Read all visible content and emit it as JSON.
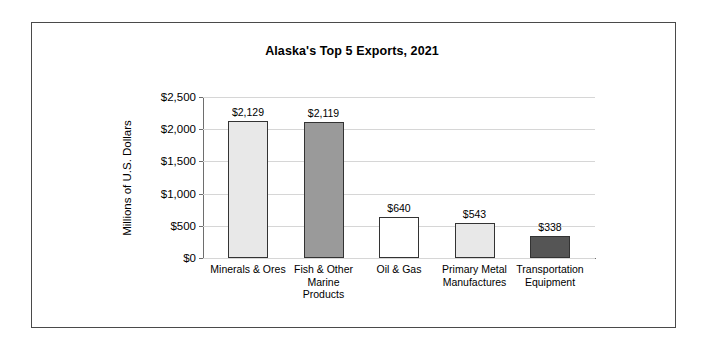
{
  "chart_data": {
    "type": "bar",
    "title": "Alaska's Top 5 Exports, 2021",
    "xlabel": "",
    "ylabel": "Millions of U.S. Dollars",
    "categories": [
      "Minerals & Ores",
      "Fish & Other Marine Products",
      "Oil & Gas",
      "Primary Metal Manufactures",
      "Transportation Equipment"
    ],
    "values": [
      2129,
      2119,
      640,
      543,
      338
    ],
    "value_labels": [
      "$2,129",
      "$2,119",
      "$640",
      "$543",
      "$338"
    ],
    "bar_colors": [
      "#e8e8e8",
      "#9a9a9a",
      "#ffffff",
      "#e8e8e8",
      "#555555"
    ],
    "bar_border_color": "#333333",
    "ylim": [
      0,
      2500
    ],
    "ytick_values": [
      0,
      500,
      1000,
      1500,
      2000,
      2500
    ],
    "ytick_labels": [
      "$0",
      "$500",
      "$1,000",
      "$1,500",
      "$2,000",
      "$2,500"
    ],
    "grid": true,
    "grid_color": "#d6d6d6",
    "legend": "none"
  },
  "frame": {
    "border_color": "#4a4a4a"
  }
}
